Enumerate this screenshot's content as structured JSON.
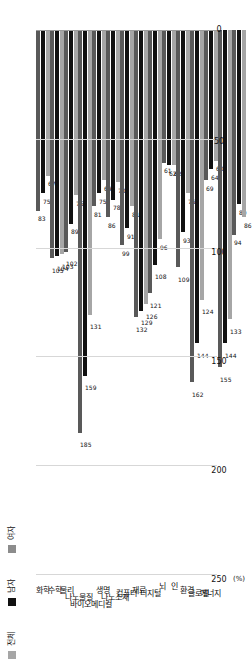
{
  "chart_data": {
    "type": "bar",
    "orientation": "horizontal-rotated",
    "title": "",
    "xlabel": "",
    "ylabel": "(%)",
    "unit_label": "(%)",
    "xlim": [
      0,
      250
    ],
    "grid": true,
    "legend_position": "top-left",
    "ticks": [
      "0",
      "50",
      "100",
      "150",
      "200",
      "250"
    ],
    "tick_values": [
      0,
      50,
      100,
      150,
      200,
      250
    ],
    "categories": [
      "화학",
      "수학",
      "물리",
      "나노물질",
      "바이오메디컬",
      "생명",
      "나노소재",
      "컴퓨터",
      "재료",
      "디지털",
      "뇌",
      "인",
      "환경",
      "글로벌",
      "에너지"
    ],
    "series": [
      {
        "name": "전체",
        "color": "#595959",
        "values": [
          83,
          105,
          102,
          185,
          81,
          86,
          99,
          132,
          121,
          61,
          109,
          162,
          69,
          155,
          94
        ]
      },
      {
        "name": "남자",
        "color": "#111111",
        "values": [
          75,
          104,
          89,
          159,
          75,
          78,
          91,
          129,
          108,
          62,
          93,
          144,
          64,
          144,
          80
        ]
      },
      {
        "name": "여자",
        "color": "#a6a6a6",
        "values": [
          67,
          103,
          76,
          131,
          69,
          70,
          81,
          126,
          96,
          62,
          75,
          124,
          60,
          133,
          86
        ]
      }
    ],
    "legend": [
      {
        "label": "전체",
        "color": "#a6a6a6"
      },
      {
        "label": "남자",
        "color": "#111111"
      },
      {
        "label": "여자",
        "color": "#8c8c8c"
      }
    ]
  }
}
